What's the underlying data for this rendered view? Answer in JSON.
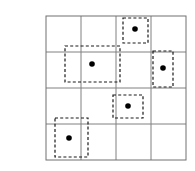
{
  "figure": {
    "title": "",
    "background_color": "#ffffff",
    "top_band_color": "#ededed"
  },
  "chart_data": {
    "type": "scatter",
    "title": "",
    "subtitle": "",
    "xlabel": "",
    "ylabel": "",
    "xlim": [
      0,
      4
    ],
    "ylim": [
      0,
      4
    ],
    "grid": true,
    "grid_rows": 4,
    "grid_columns": 4,
    "grid_line_color": "#808080",
    "grid_line_width": 1,
    "border_color": "#707070",
    "legend": "none",
    "annotations": [],
    "x": [
      2.55,
      1.33,
      3.37,
      2.35,
      0.67
    ],
    "y": [
      3.64,
      2.67,
      2.13,
      1.5,
      0.61
    ],
    "point_color": "#000000",
    "point_marker": "filled-circle",
    "point_size": 5,
    "points": [
      {
        "id": "point-1",
        "x": 2.55,
        "y": 3.64,
        "px": 135,
        "py": 29,
        "cell_row": 0,
        "cell_col": 2
      },
      {
        "id": "point-2",
        "x": 1.33,
        "y": 2.67,
        "px": 92,
        "py": 64,
        "cell_row": 1,
        "cell_col": 1
      },
      {
        "id": "point-3",
        "x": 3.37,
        "y": 2.13,
        "px": 163,
        "py": 68,
        "cell_row": 1,
        "cell_col": 3
      },
      {
        "id": "point-4",
        "x": 2.35,
        "y": 1.5,
        "px": 128,
        "py": 106,
        "cell_row": 2,
        "cell_col": 2
      },
      {
        "id": "point-5",
        "x": 0.67,
        "y": 0.61,
        "px": 69,
        "py": 138,
        "cell_row": 3,
        "cell_col": 0
      }
    ],
    "boxes": [
      {
        "id": "box-1",
        "label": "dashed-box-1",
        "px": 123,
        "py": 18,
        "pw": 25,
        "ph": 25,
        "style": "dashed",
        "color": "#1a1a1a"
      },
      {
        "id": "box-2",
        "label": "dashed-box-2",
        "px": 65,
        "py": 46,
        "pw": 55,
        "ph": 36,
        "style": "dashed",
        "color": "#1a1a1a"
      },
      {
        "id": "box-3",
        "label": "dashed-box-3",
        "px": 153,
        "py": 51,
        "pw": 20,
        "ph": 36,
        "style": "dashed",
        "color": "#1a1a1a"
      },
      {
        "id": "box-4",
        "label": "dashed-box-4",
        "px": 113,
        "py": 95,
        "pw": 30,
        "ph": 23,
        "style": "dashed",
        "color": "#1a1a1a"
      },
      {
        "id": "box-5",
        "label": "dashed-box-5",
        "px": 55,
        "py": 118,
        "pw": 33,
        "ph": 39,
        "style": "dashed",
        "color": "#1a1a1a"
      }
    ],
    "grid_geometry": {
      "left": 46,
      "top": 16,
      "right": 186,
      "bottom": 160,
      "x_lines": [
        46,
        81,
        116,
        151,
        186
      ],
      "y_lines": [
        16,
        52,
        88,
        124,
        160
      ]
    },
    "xticks": [],
    "yticks": [],
    "xticklabels": [],
    "yticklabels": []
  }
}
